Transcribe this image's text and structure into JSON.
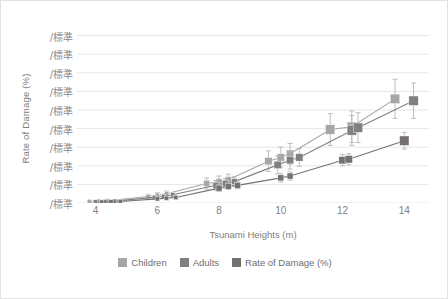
{
  "chart_data": {
    "type": "line",
    "title": "",
    "xlabel": "Tsunami Heights (m)",
    "ylabel": "Rate of Damage (%)",
    "xlim": [
      3.4,
      14.8
    ],
    "ylim": [
      0,
      10
    ],
    "grid": true,
    "xticks": [
      4,
      6,
      8,
      10,
      12,
      14
    ],
    "yticks": [
      "/標準",
      "/標準",
      "/標準",
      "/標準",
      "/標準",
      "/標準",
      "/標準",
      "/標準",
      "/標準",
      "/標準"
    ],
    "ytick_values": [
      9,
      8,
      7,
      6,
      5,
      4,
      3,
      2,
      1,
      0
    ],
    "legend_position": "bottom",
    "series": [
      {
        "name": "Children",
        "color": "#a6a6a6",
        "marker": "square",
        "x": [
          3.8,
          4.1,
          4.4,
          5.7,
          6.0,
          6.3,
          7.6,
          8.0,
          8.3,
          9.6,
          10.0,
          10.3,
          11.6,
          12.3,
          13.7
        ],
        "y": [
          0.08,
          0.1,
          0.12,
          0.35,
          0.42,
          0.5,
          1.05,
          1.15,
          1.25,
          2.25,
          2.45,
          2.65,
          3.95,
          4.1,
          5.6
        ],
        "yerr": [
          0.06,
          0.06,
          0.07,
          0.12,
          0.13,
          0.14,
          0.3,
          0.3,
          0.3,
          0.55,
          0.55,
          0.55,
          0.85,
          0.85,
          1.05
        ]
      },
      {
        "name": "Adults",
        "color": "#808080",
        "marker": "square",
        "x": [
          4.0,
          4.3,
          4.6,
          5.9,
          6.2,
          6.5,
          7.9,
          8.2,
          8.5,
          9.9,
          10.3,
          10.6,
          12.3,
          12.5,
          14.3
        ],
        "y": [
          0.06,
          0.08,
          0.1,
          0.3,
          0.36,
          0.44,
          0.95,
          1.05,
          1.15,
          2.05,
          2.3,
          2.45,
          3.9,
          4.05,
          5.5
        ],
        "yerr": [
          0.05,
          0.05,
          0.06,
          0.1,
          0.11,
          0.12,
          0.26,
          0.26,
          0.26,
          0.48,
          0.48,
          0.48,
          0.8,
          0.8,
          0.95
        ]
      },
      {
        "name": "Rate of Damage (%)",
        "color": "#767171",
        "marker": "square",
        "x": [
          4.2,
          4.5,
          4.8,
          6.0,
          6.3,
          6.6,
          8.0,
          8.3,
          8.6,
          10.0,
          10.3,
          12.0,
          12.2,
          14.0
        ],
        "y": [
          0.05,
          0.06,
          0.08,
          0.22,
          0.26,
          0.3,
          0.8,
          0.9,
          0.95,
          1.35,
          1.45,
          2.3,
          2.35,
          3.35
        ],
        "yerr": [
          0.04,
          0.04,
          0.05,
          0.09,
          0.09,
          0.1,
          0.18,
          0.18,
          0.18,
          0.22,
          0.22,
          0.3,
          0.3,
          0.45
        ]
      }
    ]
  },
  "legend": {
    "items": [
      {
        "label": "Children",
        "color": "#a6a6a6"
      },
      {
        "label": "Adults",
        "color": "#808080"
      },
      {
        "label": "Rate of Damage (%)",
        "color": "#767171"
      }
    ]
  },
  "axes": {
    "x_title": "Tsunami Heights (m)",
    "y_title": "Rate of Damage (%)"
  }
}
